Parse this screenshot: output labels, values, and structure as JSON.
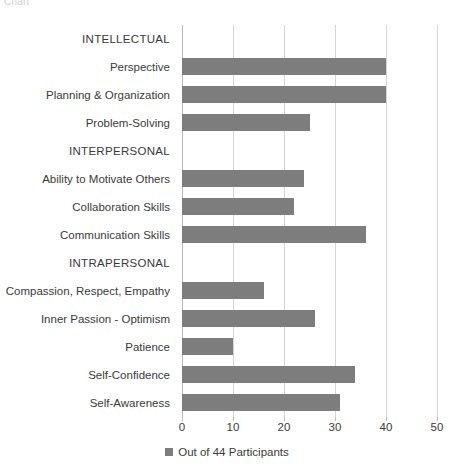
{
  "page": {
    "cut_off_header": "Chart"
  },
  "legend": {
    "label": "Out of 44 Participants",
    "swatch_color": "#7d7d7d",
    "position": "bottom-center"
  },
  "axis": {
    "x_ticks": [
      "0",
      "10",
      "20",
      "30",
      "40",
      "50"
    ]
  },
  "chart_data": {
    "type": "bar",
    "orientation": "horizontal",
    "title": "",
    "subtitle": "",
    "xlabel": "",
    "ylabel": "",
    "xlim": [
      0,
      50
    ],
    "x_ticks": [
      0,
      10,
      20,
      30,
      40,
      50
    ],
    "grid": true,
    "legend": [
      "Out of 44 Participants"
    ],
    "legend_position": "bottom-center",
    "bar_color": "#7d7d7d",
    "categories": [
      "INTELLECTUAL",
      "Perspective",
      "Planning & Organization",
      "Problem-Solving",
      "INTERPERSONAL",
      "Ability to Motivate Others",
      "Collaboration Skills",
      "Communication Skills",
      "INTRAPERSONAL",
      "Compassion, Respect, Empathy",
      "Inner Passion - Optimism",
      "Patience",
      "Self-Confidence",
      "Self-Awareness"
    ],
    "values": [
      0,
      40,
      40,
      25,
      0,
      24,
      22,
      36,
      0,
      16,
      26,
      10,
      34,
      31
    ],
    "group_headers": [
      "INTELLECTUAL",
      "INTERPERSONAL",
      "INTRAPERSONAL"
    ],
    "series": [
      {
        "name": "Out of 44 Participants",
        "values": [
          0,
          40,
          40,
          25,
          0,
          24,
          22,
          36,
          0,
          16,
          26,
          10,
          34,
          31
        ]
      }
    ]
  }
}
